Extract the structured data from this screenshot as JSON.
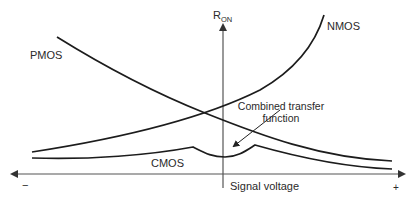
{
  "diagram": {
    "axes": {
      "vertical_label_main": "R",
      "vertical_label_sub": "ON",
      "horizontal_label": "Signal voltage",
      "negative_end": "−",
      "positive_end": "+"
    },
    "curves": [
      {
        "id": "pmos",
        "label": "PMOS",
        "trend": "decreasing with signal voltage"
      },
      {
        "id": "nmos",
        "label": "NMOS",
        "trend": "increasing with signal voltage"
      },
      {
        "id": "cmos",
        "label": "CMOS",
        "trend": "low and flat, parallel combination"
      }
    ],
    "annotation": {
      "line1": "Combined transfer",
      "line2": "function"
    },
    "colors": {
      "curve": "#1c1c1c",
      "axis": "#555555",
      "text": "#2a2a2a"
    }
  }
}
